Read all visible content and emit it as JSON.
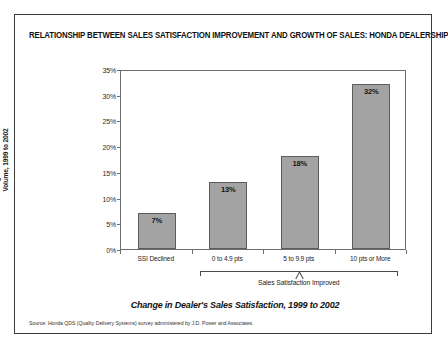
{
  "figure": {
    "title": "RELATIONSHIP BETWEEN SALES SATISFACTION IMPROVEMENT AND GROWTH OF SALES: HONDA DEALERSHIPS",
    "source_note": "Source: Honda QDS (Quality Delivery Systems) survey administered by J.D. Power and Associates.",
    "group_bracket_label": "Sales Satisfaction Improved",
    "y_axis_title_line1": "Change in Dealer's Sales",
    "y_axis_title_line2": "Volume, 1999 to 2002",
    "colors": {
      "bar_fill": "#a3a3a3",
      "bar_border": "#5d5d5d",
      "frame": "#6e6e6e",
      "outer_border": "#3a3a3a"
    }
  },
  "chart_data": {
    "type": "bar",
    "title": "RELATIONSHIP BETWEEN SALES SATISFACTION IMPROVEMENT AND GROWTH OF SALES: HONDA DEALERSHIPS",
    "xlabel": "Change in Dealer's Sales Satisfaction, 1999 to 2002",
    "ylabel": "Change in Dealer's Sales Volume, 1999 to 2002",
    "categories": [
      "SSI Declined",
      "0 to 4.9 pts",
      "5 to 9.9 pts",
      "10 pts or More"
    ],
    "values": [
      7,
      13,
      18,
      32
    ],
    "value_labels": [
      "7%",
      "13%",
      "18%",
      "32%"
    ],
    "ylim": [
      0,
      35
    ],
    "ytick_values": [
      0,
      5,
      10,
      15,
      20,
      25,
      30,
      35
    ],
    "ytick_labels": [
      "0%",
      "5%",
      "10%",
      "15%",
      "20%",
      "25%",
      "30%",
      "35%"
    ],
    "grid": false,
    "legend": "none",
    "annotations": [
      {
        "text": "Sales Satisfaction Improved",
        "covers_categories": [
          "0 to 4.9 pts",
          "5 to 9.9 pts",
          "10 pts or More"
        ]
      }
    ]
  }
}
